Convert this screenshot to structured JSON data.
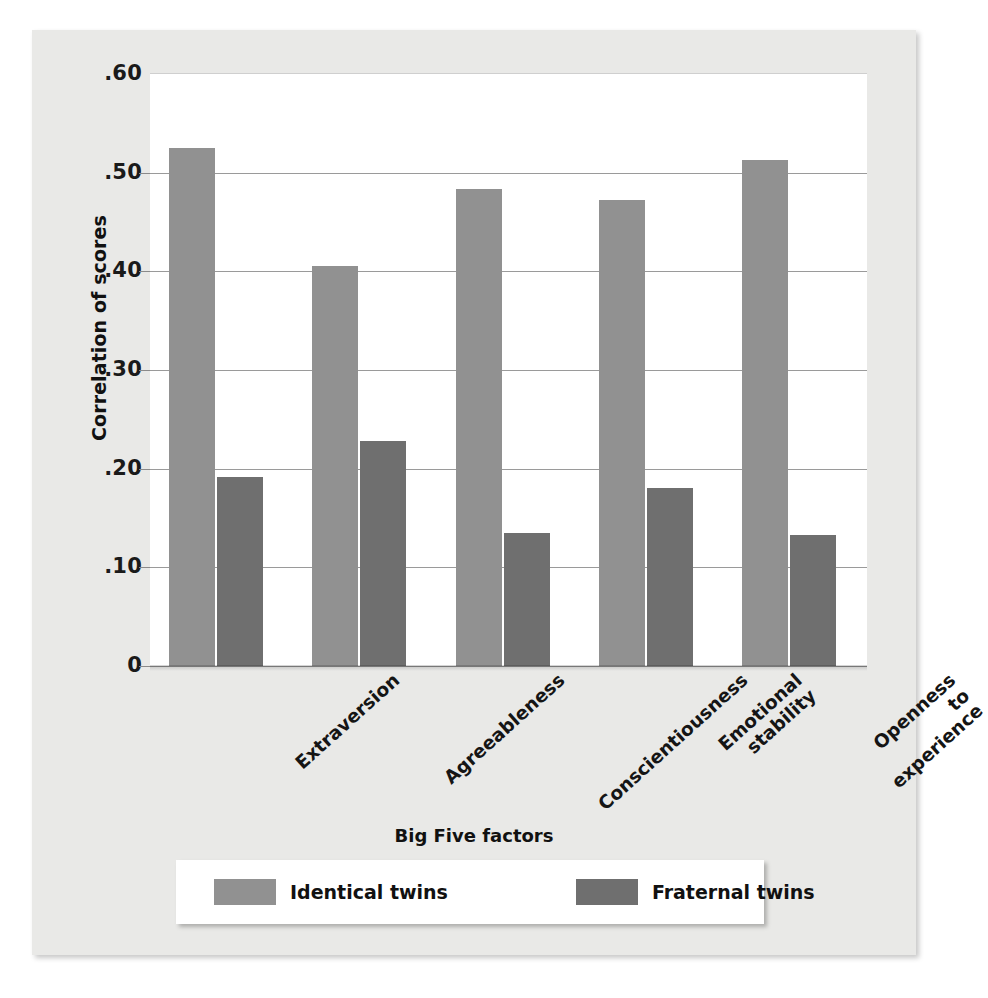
{
  "chart_data": {
    "type": "bar",
    "title": "",
    "xlabel": "Big Five factors",
    "ylabel": "Correlation of scores",
    "categories": [
      "Extraversion",
      "Agreeableness",
      "Conscientiousness",
      "Emotional\nstability",
      "Openness\nto\nexperience"
    ],
    "series": [
      {
        "name": "Identical twins",
        "color": "#919191",
        "values": [
          0.525,
          0.405,
          0.483,
          0.472,
          0.513
        ]
      },
      {
        "name": "Fraternal twins",
        "color": "#6f6f6f",
        "values": [
          0.192,
          0.228,
          0.135,
          0.18,
          0.133
        ]
      }
    ],
    "ylim": [
      0,
      0.6
    ],
    "ytick_values": [
      0.6,
      0.5,
      0.4,
      0.3,
      0.2,
      0.1,
      0
    ],
    "ytick_labels": [
      ".60",
      ".50",
      ".40",
      ".30",
      ".20",
      ".10",
      "0"
    ],
    "grid": "horizontal",
    "legend_position": "bottom"
  },
  "legend": {
    "items": [
      {
        "label": "Identical twins",
        "swatch": "identical"
      },
      {
        "label": "Fraternal twins",
        "swatch": "fraternal"
      }
    ]
  }
}
